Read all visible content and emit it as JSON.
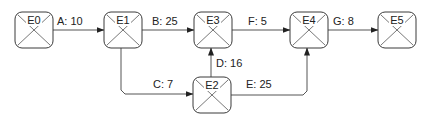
{
  "diagram": {
    "type": "activity-network",
    "nodes": [
      {
        "id": "E0",
        "label": "E0",
        "x": 15,
        "y": 12,
        "w": 38,
        "h": 36
      },
      {
        "id": "E1",
        "label": "E1",
        "x": 104,
        "y": 12,
        "w": 38,
        "h": 36
      },
      {
        "id": "E3",
        "label": "E3",
        "x": 194,
        "y": 12,
        "w": 38,
        "h": 36
      },
      {
        "id": "E4",
        "label": "E4",
        "x": 290,
        "y": 12,
        "w": 38,
        "h": 36
      },
      {
        "id": "E5",
        "label": "E5",
        "x": 378,
        "y": 12,
        "w": 38,
        "h": 36
      },
      {
        "id": "E2",
        "label": "E2",
        "x": 193,
        "y": 77,
        "w": 38,
        "h": 36
      }
    ],
    "edges": [
      {
        "id": "A",
        "label": "A: 10",
        "from": "E0",
        "to": "E1",
        "points": "53,30 104,30",
        "lx": 57,
        "ly": 25
      },
      {
        "id": "B",
        "label": "B: 25",
        "from": "E1",
        "to": "E3",
        "points": "142,30 194,30",
        "lx": 152,
        "ly": 25
      },
      {
        "id": "F",
        "label": "F: 5",
        "from": "E3",
        "to": "E4",
        "points": "232,30 290,30",
        "lx": 248,
        "ly": 25
      },
      {
        "id": "G",
        "label": "G: 8",
        "from": "E4",
        "to": "E5",
        "points": "328,30 378,30",
        "lx": 333,
        "ly": 25
      },
      {
        "id": "D",
        "label": "D: 16",
        "from": "E2",
        "to": "E3",
        "points": "211,77 211,48",
        "lx": 216,
        "ly": 67
      },
      {
        "id": "C",
        "label": "C: 7",
        "from": "E1",
        "to": "E2",
        "points": "121,48 121,90 125,94 193,94",
        "lx": 153,
        "ly": 88
      },
      {
        "id": "E",
        "label": "E: 25",
        "from": "E2",
        "to": "E4",
        "points": "231,95 303,95 307,91 307,48",
        "lx": 246,
        "ly": 88
      }
    ]
  }
}
